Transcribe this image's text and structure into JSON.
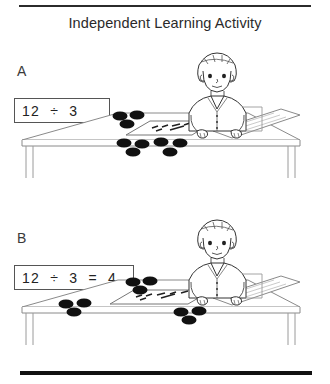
{
  "document": {
    "title": "Independent Learning Activity",
    "top_rule": "horizontal-rule",
    "bottom_rule": "horizontal-rule"
  },
  "panels": [
    {
      "label": "A",
      "equation": "12  ÷  3",
      "scene": {
        "description": "child seated at desk with counters",
        "card_text": "12 ÷ 3",
        "worksheet_text": "12 ÷ 3",
        "groups": [
          {
            "name": "group-top-left",
            "count": 3
          },
          {
            "name": "group-top-right",
            "count": 3
          },
          {
            "name": "group-loose-pile",
            "count": 6
          }
        ]
      }
    },
    {
      "label": "B",
      "equation": "12  ÷  3  =  4",
      "scene": {
        "description": "child seated at desk with counters sorted into equal groups",
        "card_text": "12 ÷ 3 = 4",
        "worksheet_text": "12 ÷ 3 = 4",
        "groups": [
          {
            "name": "group-top-left",
            "count": 3
          },
          {
            "name": "group-top-right",
            "count": 3
          },
          {
            "name": "group-left",
            "count": 3
          },
          {
            "name": "group-bottom",
            "count": 3
          }
        ]
      }
    }
  ],
  "colors": {
    "ink": "#1a1a1a",
    "rule": "#2b2b2b",
    "counter": "#111111",
    "line": "#6f6f6f",
    "paper": "#ffffff"
  }
}
